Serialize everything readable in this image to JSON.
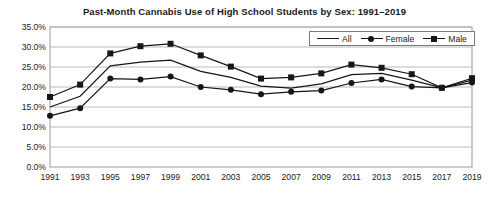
{
  "chart_data": {
    "type": "line",
    "title": "Past-Month Cannabis Use of High School Students by Sex: 1991–2019",
    "xlabel": "",
    "ylabel": "",
    "categories": [
      "1991",
      "1993",
      "1995",
      "1997",
      "1999",
      "2001",
      "2003",
      "2005",
      "2007",
      "2009",
      "2011",
      "2013",
      "2015",
      "2017",
      "2019"
    ],
    "series": [
      {
        "name": "All",
        "marker": "none",
        "values": [
          15.0,
          17.7,
          25.3,
          26.2,
          26.7,
          23.9,
          22.4,
          20.2,
          19.7,
          20.8,
          23.1,
          23.4,
          21.7,
          19.8,
          21.7
        ]
      },
      {
        "name": "Female",
        "marker": "circle",
        "values": [
          12.8,
          14.7,
          22.1,
          21.9,
          22.6,
          20.0,
          19.3,
          18.2,
          18.8,
          19.1,
          21.0,
          21.9,
          20.1,
          19.8,
          21.1
        ]
      },
      {
        "name": "Male",
        "marker": "square",
        "values": [
          17.5,
          20.6,
          28.4,
          30.2,
          30.8,
          27.9,
          25.1,
          22.1,
          22.4,
          23.4,
          25.6,
          24.8,
          23.2,
          19.8,
          22.2
        ]
      }
    ],
    "ylim": [
      0,
      35
    ],
    "ytick_step": 5,
    "yticks": [
      "0.0%",
      "5.0%",
      "10.0%",
      "15.0%",
      "20.0%",
      "25.0%",
      "30.0%",
      "35.0%"
    ],
    "ytick_values": [
      0,
      5,
      10,
      15,
      20,
      25,
      30,
      35
    ],
    "grid": true,
    "legend_position": "top-right",
    "colors": {
      "line": "#161616",
      "grid": "#b9b9b9",
      "axis": "#9a9a9a",
      "text": "#1a1a1a",
      "background": "#ffffff"
    }
  }
}
